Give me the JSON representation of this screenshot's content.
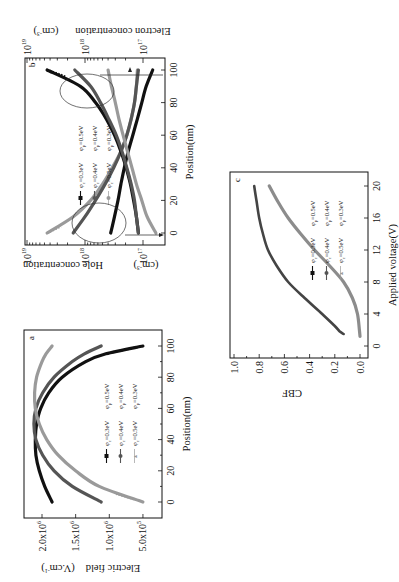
{
  "figure": {
    "orientation": "rotated 90 degrees counter-clockwise",
    "colors": {
      "black": "#111111",
      "dark_gray": "#555555",
      "light_gray": "#9a9a9a"
    }
  },
  "chart_data": [
    {
      "panel": "a",
      "type": "line",
      "title": "",
      "xlabel": "Position(nm)",
      "ylabel": "Electric field (V.cm⁻¹)",
      "xlim": [
        -10,
        110
      ],
      "ylim": [
        200000,
        2270000
      ],
      "x_ticks": [
        0,
        20,
        40,
        60,
        80,
        100
      ],
      "y_ticks": [
        {
          "value": 2000000,
          "label": "2.0x10",
          "exp": "6"
        },
        {
          "value": 1500000,
          "label": "1.5x10",
          "exp": "6"
        },
        {
          "value": 1000000,
          "label": "1.0x10",
          "exp": "6"
        },
        {
          "value": 500000,
          "label": "5.0x10",
          "exp": "5"
        }
      ],
      "legend": [
        [
          "φc=0.3eV",
          "φp=0.5eV"
        ],
        [
          "φc=0.4eV",
          "φp=0.4eV"
        ],
        [
          "φc=0.5eV",
          "φp=0.3eV"
        ]
      ],
      "x": [
        0,
        10,
        20,
        30,
        40,
        50,
        60,
        70,
        80,
        90,
        95,
        100
      ],
      "series": [
        {
          "name": "φc=0.3eV φp=0.5eV",
          "color": "#111111",
          "values": [
            1850000,
            1960000,
            2040000,
            2090000,
            2100000,
            2080000,
            2020000,
            1900000,
            1700000,
            1350000,
            1050000,
            500000
          ]
        },
        {
          "name": "φc=0.4eV φp=0.4eV",
          "color": "#555555",
          "values": [
            1120000,
            1550000,
            1820000,
            1990000,
            2090000,
            2120000,
            2090000,
            1990000,
            1820000,
            1550000,
            1370000,
            1120000
          ]
        },
        {
          "name": "φc=0.5eV φp=0.3eV",
          "color": "#9a9a9a",
          "values": [
            500000,
            1150000,
            1500000,
            1760000,
            1930000,
            2040000,
            2100000,
            2110000,
            2080000,
            2000000,
            1940000,
            1850000
          ]
        }
      ]
    },
    {
      "panel": "b",
      "type": "line",
      "title": "",
      "xlabel": "Position(nm)",
      "ylabel_left": "Hole concentration (cm⁻³)",
      "ylabel_right": "Electron concentration (cm⁻³)",
      "yscale": "log",
      "xlim": [
        -7,
        108
      ],
      "ylim": [
        4.2e+16,
        1.05e+19
      ],
      "x_ticks": [
        0,
        20,
        40,
        60,
        80,
        100
      ],
      "y_ticks": [
        {
          "value": 1e+19,
          "label": "10",
          "exp": "19"
        },
        {
          "value": 1e+18,
          "label": "10",
          "exp": "18"
        },
        {
          "value": 1e+17,
          "label": "10",
          "exp": "17"
        }
      ],
      "legend": [
        [
          "φc=0.3eV",
          "φp=0.5eV"
        ],
        [
          "φc=0.4eV",
          "φp=0.4eV"
        ],
        [
          "φc=0.5eV",
          "φp=0.3eV"
        ]
      ],
      "annotations": [
        "ellipse near x=10 with arrow pointing to left axis (holes)",
        "ellipse near x=90 with arrow pointing to right axis (electrons)"
      ],
      "x": [
        0,
        10,
        20,
        30,
        40,
        50,
        60,
        70,
        80,
        90,
        100
      ],
      "series": [
        {
          "name": "hole φc=0.5eV φp=0.3eV",
          "color": "#9a9a9a",
          "values": [
            4.5e+18,
            1.6e+18,
            8e+17,
            5e+17,
            3.4e+17,
            2.4e+17,
            1.9e+17,
            1.6e+17,
            1.4e+17,
            1.3e+17,
            1.25e+17
          ]
        },
        {
          "name": "hole φc=0.4eV φp=0.4eV",
          "color": "#555555",
          "values": [
            1.6e+18,
            1e+18,
            6.6e+17,
            4.5e+17,
            3.2e+17,
            2.4e+17,
            1.9e+17,
            1.6e+17,
            1.4e+17,
            1.3e+17,
            1.2e+17
          ]
        },
        {
          "name": "hole φc=0.3eV φp=0.5eV",
          "color": "#111111",
          "values": [
            3.6e+17,
            3.1e+17,
            2.7e+17,
            2.4e+17,
            2.1e+17,
            1.8e+17,
            1.5e+17,
            1.25e+17,
            1.05e+17,
            8.8e+16,
            6.8e+16
          ]
        },
        {
          "name": "electron φc=0.3eV φp=0.5eV",
          "color": "#111111",
          "values": [
            1.2e+17,
            1.3e+17,
            1.45e+17,
            1.65e+17,
            1.95e+17,
            2.4e+17,
            3.1e+17,
            4.3e+17,
            6.6e+17,
            1.2e+18,
            4.5e+18
          ]
        },
        {
          "name": "electron φc=0.4eV φp=0.4eV",
          "color": "#555555",
          "values": [
            1.2e+17,
            1.3e+17,
            1.4e+17,
            1.6e+17,
            1.9e+17,
            2.3e+17,
            2.9e+17,
            3.9e+17,
            5.4e+17,
            8e+17,
            1.5e+18
          ]
        },
        {
          "name": "electron φc=0.5eV φp=0.3eV",
          "color": "#9a9a9a",
          "values": [
            6e+16,
            8.5e+16,
            1.05e+17,
            1.3e+17,
            1.55e+17,
            1.85e+17,
            2.2e+17,
            2.6e+17,
            3e+17,
            3.5e+17,
            4e+17
          ]
        }
      ]
    },
    {
      "panel": "c",
      "type": "line",
      "title": "",
      "xlabel": "Applied voltage(V)",
      "ylabel": "CBF",
      "xlim": [
        -1.5,
        22.5
      ],
      "ylim": [
        -0.08,
        1.0
      ],
      "x_ticks": [
        0,
        4,
        8,
        12,
        16,
        20
      ],
      "y_ticks": [
        0.0,
        0.2,
        0.4,
        0.6,
        0.8,
        1.0
      ],
      "legend": [
        [
          "φc=0.3eV",
          "φp=0.5eV"
        ],
        [
          "φc=0.4eV",
          "φp=0.4eV"
        ],
        [
          "φc=0.5eV",
          "φp=0.3eV"
        ]
      ],
      "series": [
        {
          "name": "φc=0.3eV φp=0.5eV",
          "color": "#444444",
          "x": [
            1.5,
            1.8,
            2.5,
            4,
            6,
            8,
            10,
            12,
            14,
            16,
            18,
            20
          ],
          "values": [
            0.13,
            0.16,
            0.2,
            0.3,
            0.44,
            0.57,
            0.66,
            0.73,
            0.77,
            0.8,
            0.82,
            0.84
          ]
        },
        {
          "name": "φc=0.5eV φp=0.3eV",
          "color": "#8c8c8c",
          "x": [
            1.2,
            2,
            4,
            6,
            8,
            10,
            12,
            14,
            16,
            18,
            20
          ],
          "values": [
            0.0,
            0.005,
            0.02,
            0.06,
            0.13,
            0.24,
            0.36,
            0.47,
            0.57,
            0.65,
            0.72
          ]
        }
      ]
    }
  ],
  "panels": {
    "a": {
      "label": "a",
      "xlabel": "Position(nm)",
      "ylabel_main": "Electric field",
      "ylabel_unit": "(V.cm",
      "ylabel_unit_exp": "-1",
      "ylabel_unit_close": ")",
      "x_tick_labels": [
        "0",
        "20",
        "40",
        "60",
        "80",
        "100"
      ],
      "y_tick_labels": [
        {
          "mant": "2.0x10",
          "exp": "6"
        },
        {
          "mant": "1.5x10",
          "exp": "6"
        },
        {
          "mant": "1.0x10",
          "exp": "6"
        },
        {
          "mant": "5.0x10",
          "exp": "5"
        }
      ],
      "legend": [
        {
          "c": "φ",
          "c_sub": "c",
          "c_val": "=0.3eV",
          "p": "φ",
          "p_sub": "p",
          "p_val": "=0.5eV"
        },
        {
          "c": "φ",
          "c_sub": "c",
          "c_val": "=0.4eV",
          "p": "φ",
          "p_sub": "p",
          "p_val": "=0.4eV"
        },
        {
          "c": "φ",
          "c_sub": "c",
          "c_val": "=0.5eV",
          "p": "φ",
          "p_sub": "p",
          "p_val": "=0.3eV"
        }
      ]
    },
    "b": {
      "label": "b",
      "xlabel": "Position(nm)",
      "ylabel_left_main": "Hole concentration",
      "ylabel_right_main": "Electron concentration",
      "ylabel_unit": "(cm",
      "ylabel_unit_exp": "-3",
      "ylabel_unit_close": ")",
      "x_tick_labels": [
        "0",
        "20",
        "40",
        "60",
        "80",
        "100"
      ],
      "y_tick_labels": [
        {
          "mant": "10",
          "exp": "19"
        },
        {
          "mant": "10",
          "exp": "18"
        },
        {
          "mant": "10",
          "exp": "17"
        }
      ],
      "legend": [
        {
          "c": "φ",
          "c_sub": "c",
          "c_val": "=0.3eV",
          "p": "φ",
          "p_sub": "p",
          "p_val": "=0.5eV"
        },
        {
          "c": "φ",
          "c_sub": "c",
          "c_val": "=0.4eV",
          "p": "φ",
          "p_sub": "p",
          "p_val": "=0.4eV"
        },
        {
          "c": "φ",
          "c_sub": "c",
          "c_val": "=0.5eV",
          "p": "φ",
          "p_sub": "p",
          "p_val": "=0.3eV"
        }
      ]
    },
    "c": {
      "label": "c",
      "xlabel": "Applied voltage(V)",
      "ylabel": "CBF",
      "x_tick_labels": [
        "0",
        "4",
        "8",
        "12",
        "16",
        "20"
      ],
      "y_tick_labels": [
        "0.0",
        "0.2",
        "0.4",
        "0.6",
        "0.8",
        "1.0"
      ],
      "legend": [
        {
          "c": "φ",
          "c_sub": "c",
          "c_val": "=0.3eV",
          "p": "φ",
          "p_sub": "p",
          "p_val": "=0.5eV"
        },
        {
          "c": "φ",
          "c_sub": "c",
          "c_val": "=0.4eV",
          "p": "φ",
          "p_sub": "p",
          "p_val": "=0.4eV"
        },
        {
          "c": "φ",
          "c_sub": "c",
          "c_val": "=0.5eV",
          "p": "φ",
          "p_sub": "p",
          "p_val": "=0.3eV"
        }
      ]
    }
  }
}
